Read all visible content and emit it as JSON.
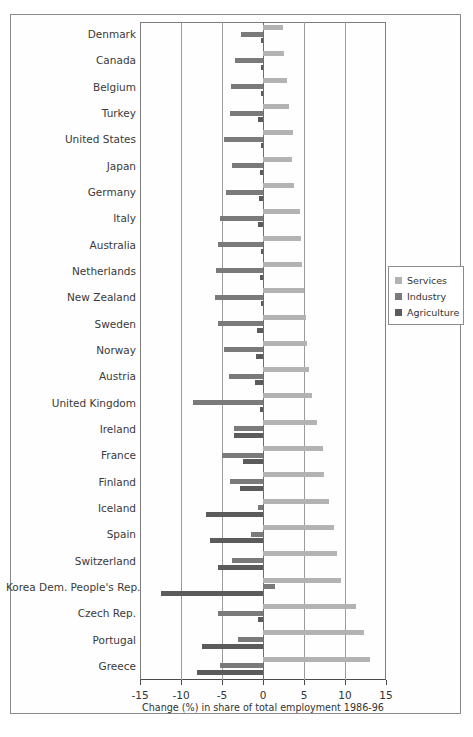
{
  "chart_data": {
    "type": "bar",
    "orientation": "horizontal",
    "title": "",
    "xlabel": "Change (%) in share of total employment 1986-96",
    "ylabel": "",
    "xlim": [
      -15,
      15
    ],
    "xticks": [
      -15,
      -10,
      -5,
      0,
      5,
      10,
      15
    ],
    "xtick_labels": [
      "-15",
      "-10",
      "-5",
      "0",
      "5",
      "10",
      "15"
    ],
    "grid": true,
    "grid_axis": "x",
    "legend_position": "right",
    "categories": [
      "Denmark",
      "Canada",
      "Belgium",
      "Turkey",
      "United States",
      "Japan",
      "Germany",
      "Italy",
      "Australia",
      "Netherlands",
      "New Zealand",
      "Sweden",
      "Norway",
      "Austria",
      "United Kingdom",
      "Ireland",
      "France",
      "Finland",
      "Iceland",
      "Spain",
      "Switzerland",
      "Korea Dem. People's Rep.",
      "Czech Rep.",
      "Portugal",
      "Greece"
    ],
    "series": [
      {
        "name": "Services",
        "color": "#b3b3b3",
        "values": [
          2.4,
          2.5,
          2.9,
          3.2,
          3.6,
          3.5,
          3.8,
          4.5,
          4.6,
          4.8,
          5.0,
          5.2,
          5.4,
          5.6,
          6.0,
          6.6,
          7.3,
          7.4,
          8.0,
          8.6,
          9.0,
          9.5,
          11.3,
          12.3,
          13.0
        ]
      },
      {
        "name": "Industry",
        "color": "#7a7a7a",
        "values": [
          -2.7,
          -3.4,
          -3.9,
          -4.0,
          -4.7,
          -3.8,
          -4.5,
          -5.3,
          -5.5,
          -5.7,
          -5.8,
          -5.5,
          -4.8,
          -4.2,
          -8.5,
          -3.5,
          -5.0,
          -4.0,
          -0.6,
          -1.5,
          -3.8,
          1.5,
          -5.5,
          -3.0,
          -5.2
        ]
      },
      {
        "name": "Agriculture",
        "color": "#5b5b5b",
        "values": [
          -0.3,
          -0.2,
          -0.3,
          -0.6,
          -0.2,
          -0.4,
          -0.5,
          -0.6,
          -0.3,
          -0.4,
          -0.3,
          -0.7,
          -0.8,
          -1.0,
          -0.4,
          -3.5,
          -2.5,
          -2.8,
          -7.0,
          -6.5,
          -5.5,
          -12.5,
          -0.6,
          -7.5,
          -8.0
        ]
      }
    ]
  },
  "legend": {
    "items": [
      {
        "label": "Services",
        "key": "services"
      },
      {
        "label": "Industry",
        "key": "industry"
      },
      {
        "label": "Agriculture",
        "key": "agriculture"
      }
    ]
  }
}
